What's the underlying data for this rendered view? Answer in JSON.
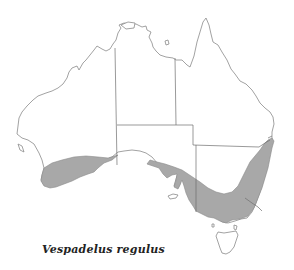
{
  "map": {
    "region": "Australia",
    "caption": "Vespadelus regulus",
    "colors": {
      "land": "#ffffff",
      "coastline": "#8a8a8a",
      "state_borders": "#6e6e6e",
      "distribution_fill": "#a8a8a8",
      "caption_text": "#222222"
    },
    "distribution_areas": [
      "south-west Western Australia",
      "southern South Australia",
      "Victoria and eastern New South Wales"
    ]
  }
}
